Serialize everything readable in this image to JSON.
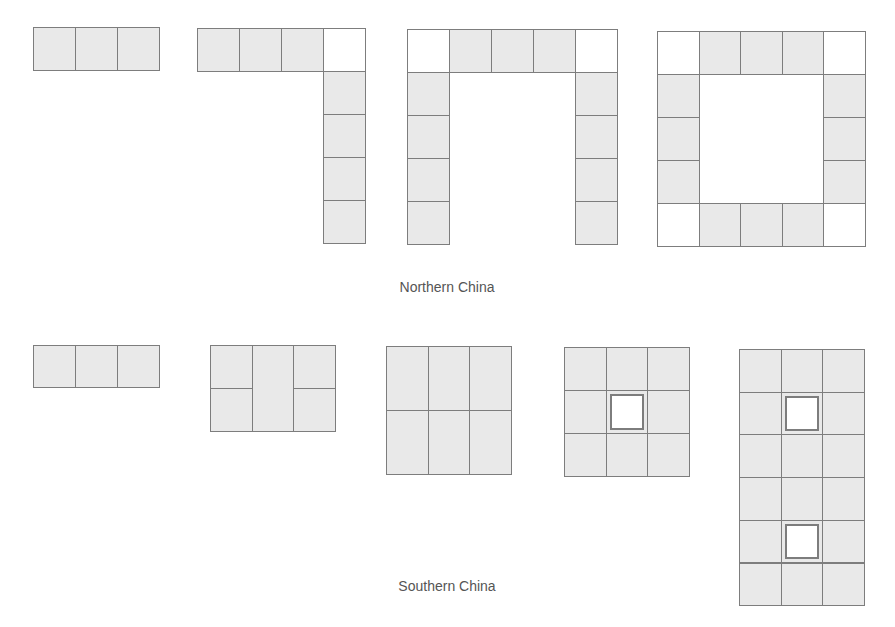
{
  "figure": {
    "colors": {
      "fill": "#e9e9e9",
      "border": "#7d7d7d",
      "empty": "#ffffff",
      "caption": "#555555"
    },
    "groups": [
      {
        "label": "Northern China",
        "label_pos": {
          "x": 447,
          "y": 279
        },
        "shapes": [
          {
            "name": "north-shape-1-row",
            "x": 33,
            "y": 27,
            "cell_w": 42,
            "cell_h": 43,
            "cells": [
              [
                0,
                0,
                "fill"
              ],
              [
                1,
                0,
                "fill"
              ],
              [
                2,
                0,
                "fill"
              ]
            ]
          },
          {
            "name": "north-shape-2-l",
            "x": 197,
            "y": 28,
            "cell_w": 42,
            "cell_h": 43,
            "cells": [
              [
                0,
                0,
                "fill"
              ],
              [
                1,
                0,
                "fill"
              ],
              [
                2,
                0,
                "fill"
              ],
              [
                3,
                0,
                "empty"
              ],
              [
                3,
                1,
                "fill"
              ],
              [
                3,
                2,
                "fill"
              ],
              [
                3,
                3,
                "fill"
              ],
              [
                3,
                4,
                "fill"
              ]
            ]
          },
          {
            "name": "north-shape-3-u",
            "x": 407,
            "y": 29,
            "cell_w": 42,
            "cell_h": 43,
            "cells": [
              [
                0,
                0,
                "empty"
              ],
              [
                1,
                0,
                "fill"
              ],
              [
                2,
                0,
                "fill"
              ],
              [
                3,
                0,
                "fill"
              ],
              [
                4,
                0,
                "empty"
              ],
              [
                0,
                1,
                "fill"
              ],
              [
                0,
                2,
                "fill"
              ],
              [
                0,
                3,
                "fill"
              ],
              [
                0,
                4,
                "fill"
              ],
              [
                4,
                1,
                "fill"
              ],
              [
                4,
                2,
                "fill"
              ],
              [
                4,
                3,
                "fill"
              ],
              [
                4,
                4,
                "fill"
              ]
            ]
          },
          {
            "name": "north-shape-4-ring",
            "x": 657,
            "y": 31,
            "cell_w": 41.5,
            "cell_h": 43,
            "cells": [
              [
                0,
                0,
                "empty"
              ],
              [
                1,
                0,
                "fill"
              ],
              [
                2,
                0,
                "fill"
              ],
              [
                3,
                0,
                "fill"
              ],
              [
                4,
                0,
                "empty"
              ],
              [
                0,
                1,
                "fill"
              ],
              [
                0,
                2,
                "fill"
              ],
              [
                0,
                3,
                "fill"
              ],
              [
                4,
                1,
                "fill"
              ],
              [
                4,
                2,
                "fill"
              ],
              [
                4,
                3,
                "fill"
              ],
              [
                0,
                4,
                "empty"
              ],
              [
                1,
                4,
                "fill"
              ],
              [
                2,
                4,
                "fill"
              ],
              [
                3,
                4,
                "fill"
              ],
              [
                4,
                4,
                "empty"
              ]
            ]
          }
        ]
      },
      {
        "label": "Southern China",
        "label_pos": {
          "x": 447,
          "y": 578
        },
        "shapes": [
          {
            "name": "south-shape-1-row",
            "x": 33,
            "y": 345,
            "cell_w": 42,
            "cell_h": 42,
            "cells": [
              [
                0,
                0,
                "fill"
              ],
              [
                1,
                0,
                "fill"
              ],
              [
                2,
                0,
                "fill"
              ]
            ]
          },
          {
            "name": "south-shape-2-split",
            "x": 210,
            "y": 345,
            "cell_w": 41.7,
            "cell_h": 43,
            "cells": [
              [
                0,
                0,
                "fill"
              ],
              [
                0,
                1,
                "fill"
              ],
              [
                1,
                0,
                "fill",
                1,
                2
              ],
              [
                2,
                0,
                "fill"
              ],
              [
                2,
                1,
                "fill"
              ]
            ]
          },
          {
            "name": "south-shape-3-grid",
            "x": 386,
            "y": 346,
            "cell_w": 41.7,
            "cell_h": 64,
            "cells": [
              [
                0,
                0,
                "fill"
              ],
              [
                1,
                0,
                "fill"
              ],
              [
                2,
                0,
                "fill"
              ],
              [
                0,
                1,
                "fill"
              ],
              [
                1,
                1,
                "fill"
              ],
              [
                2,
                1,
                "fill"
              ]
            ]
          },
          {
            "name": "south-shape-4-courtyard",
            "x": 564,
            "y": 347,
            "cell_w": 41.5,
            "cell_h": 43,
            "cells": [
              [
                0,
                0,
                "fill"
              ],
              [
                1,
                0,
                "fill"
              ],
              [
                2,
                0,
                "fill"
              ],
              [
                0,
                1,
                "fill"
              ],
              [
                1,
                1,
                "fill"
              ],
              [
                2,
                1,
                "fill"
              ],
              [
                0,
                2,
                "fill"
              ],
              [
                1,
                2,
                "fill"
              ],
              [
                2,
                2,
                "fill"
              ]
            ],
            "holes": [
              [
                1,
                1
              ]
            ]
          },
          {
            "name": "south-shape-5-double-courtyard",
            "x": 739,
            "y": 349,
            "cell_w": 41.7,
            "cell_h": 42.7,
            "cells": [
              [
                0,
                0,
                "fill"
              ],
              [
                1,
                0,
                "fill"
              ],
              [
                2,
                0,
                "fill"
              ],
              [
                0,
                1,
                "fill"
              ],
              [
                1,
                1,
                "fill"
              ],
              [
                2,
                1,
                "fill"
              ],
              [
                0,
                2,
                "fill"
              ],
              [
                1,
                2,
                "fill"
              ],
              [
                2,
                2,
                "fill"
              ],
              [
                0,
                3,
                "fill"
              ],
              [
                1,
                3,
                "fill"
              ],
              [
                2,
                3,
                "fill"
              ],
              [
                0,
                4,
                "fill"
              ],
              [
                1,
                4,
                "fill"
              ],
              [
                2,
                4,
                "fill"
              ],
              [
                0,
                5,
                "fill"
              ],
              [
                1,
                5,
                "fill"
              ],
              [
                2,
                5,
                "fill"
              ]
            ],
            "holes": [
              [
                1,
                1
              ],
              [
                1,
                4
              ]
            ]
          }
        ]
      }
    ]
  }
}
